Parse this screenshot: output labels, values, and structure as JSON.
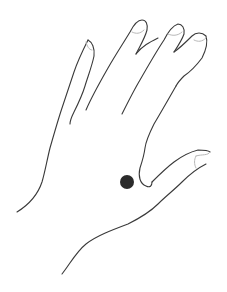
{
  "illustration": {
    "subject": "Line drawing of an open left hand, palm-down, fingers spread upward-right",
    "marker": {
      "label": "acupressure point",
      "color": "#2b2b2b",
      "cx": 127,
      "cy": 182,
      "r": 7
    },
    "stroke_color": "#3a3a3a",
    "nail_color": "#b8b8b8",
    "background": "#ffffff"
  }
}
